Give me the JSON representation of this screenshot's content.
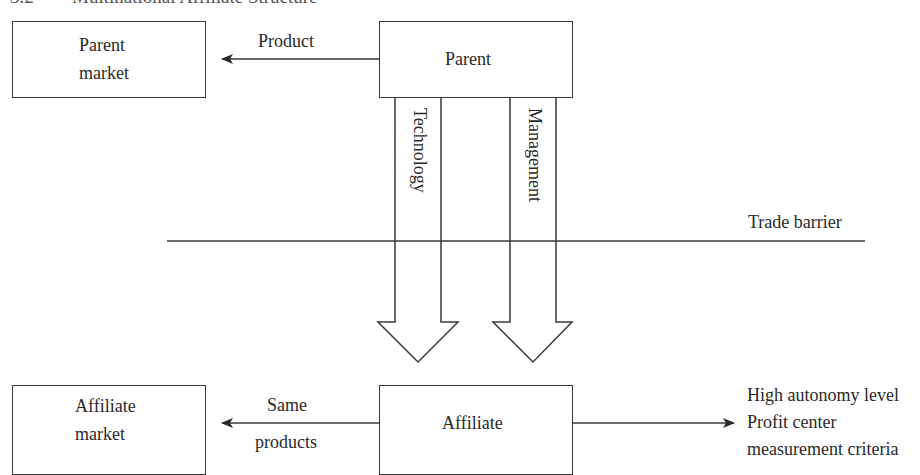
{
  "header": {
    "section_number": "3.2",
    "title": "Multinational Affiliate Structure"
  },
  "nodes": {
    "parent_market": {
      "line1": "Parent",
      "line2": "market"
    },
    "parent": {
      "label": "Parent"
    },
    "affiliate_market": {
      "line1": "Affiliate",
      "line2": "market"
    },
    "affiliate": {
      "label": "Affiliate"
    }
  },
  "edges": {
    "parent_to_market": {
      "label": "Product"
    },
    "affiliate_to_market": {
      "label_top": "Same",
      "label_bottom": "products"
    },
    "technology_transfer": {
      "label": "Technology"
    },
    "management_transfer": {
      "label": "Management"
    }
  },
  "barrier": {
    "label": "Trade barrier"
  },
  "outcomes": {
    "items": [
      "High autonomy level",
      "Profit center",
      "measurement criteria"
    ]
  },
  "colors": {
    "stroke": "#3a3a3a",
    "text": "#2a2a2a",
    "background": "#ffffff"
  }
}
